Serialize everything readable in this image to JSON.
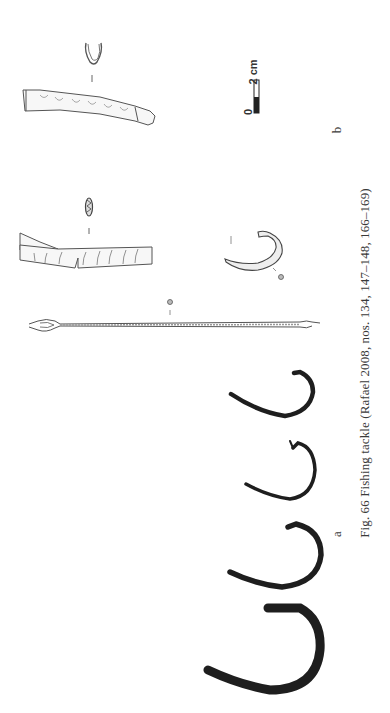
{
  "figure": {
    "caption": "Fig. 66   Fishing tackle (Rafael 2008, nos. 134, 147–148, 166–169)",
    "panel_labels": {
      "a": "a",
      "b": "b"
    },
    "scale_bar": {
      "zero_label": "0",
      "max_label": "2 cm"
    },
    "items": [
      {
        "name": "tapered-float-cross-section",
        "panel": "b"
      },
      {
        "name": "tapered-float",
        "panel": "b"
      },
      {
        "name": "ribbed-float-cross-section",
        "panel": "b"
      },
      {
        "name": "ribbed-float",
        "panel": "b"
      },
      {
        "name": "small-hook",
        "panel": "b"
      },
      {
        "name": "netting-needle",
        "panel": "b"
      },
      {
        "name": "iron-hook-1",
        "panel": "a"
      },
      {
        "name": "iron-hook-2",
        "panel": "a"
      },
      {
        "name": "iron-hook-3",
        "panel": "a"
      },
      {
        "name": "iron-hook-4",
        "panel": "a"
      }
    ],
    "colors": {
      "ink": "#2a2a2a",
      "hook_fill": "#1e1e1e",
      "line_art": "#555555",
      "background": "#ffffff"
    }
  }
}
